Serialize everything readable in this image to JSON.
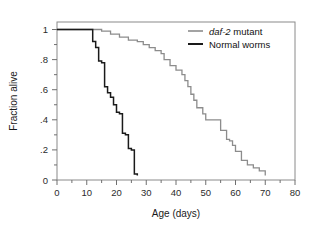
{
  "figure": {
    "background_color": "#ffffff",
    "frame_color": "#8a8a8a"
  },
  "axes": {
    "x_title": "Age (days)",
    "y_title": "Fraction alive",
    "x_ticks": [
      "0",
      "10",
      "20",
      "30",
      "40",
      "50",
      "60",
      "70",
      "80"
    ],
    "y_ticks": [
      "1",
      ".8",
      ".6",
      ".4",
      ".2",
      "0"
    ]
  },
  "legend": {
    "items": [
      {
        "label_italic": "daf-2",
        "label_rest": " mutant",
        "color": "#8c8c8c",
        "key": "daf2-mutant"
      },
      {
        "label_italic": "",
        "label_rest": "Normal worms",
        "color": "#1a1a1a",
        "key": "normal-worms"
      }
    ]
  },
  "chart_data": {
    "type": "line",
    "subtype": "kaplan-meier-survival-step",
    "title": "",
    "xlabel": "Age (days)",
    "ylabel": "Fraction alive",
    "xlim": [
      0,
      80
    ],
    "ylim": [
      0,
      1.05
    ],
    "xticks": [
      0,
      10,
      20,
      30,
      40,
      50,
      60,
      70,
      80
    ],
    "xminor_tick_interval": 5,
    "yticks": [
      0,
      0.2,
      0.4,
      0.6,
      0.8,
      1.0
    ],
    "ytick_labels": [
      "0",
      ".2",
      ".4",
      ".6",
      ".8",
      "1"
    ],
    "grid": false,
    "legend_position": "top-right",
    "series": [
      {
        "name": "daf-2 mutant",
        "color": "#8c8c8c",
        "line_width": 1.3,
        "step": "post",
        "x": [
          0,
          13,
          15,
          18,
          21,
          24,
          27,
          29,
          31,
          33,
          35,
          36,
          38,
          40,
          42,
          43,
          44,
          45,
          46,
          47,
          49,
          50,
          53,
          55,
          57,
          58,
          59,
          60,
          62,
          64,
          66,
          68,
          70
        ],
        "y": [
          1.0,
          1.0,
          0.99,
          0.97,
          0.95,
          0.93,
          0.92,
          0.9,
          0.88,
          0.86,
          0.84,
          0.8,
          0.76,
          0.73,
          0.7,
          0.66,
          0.62,
          0.57,
          0.53,
          0.48,
          0.44,
          0.4,
          0.4,
          0.33,
          0.27,
          0.26,
          0.23,
          0.19,
          0.13,
          0.1,
          0.08,
          0.06,
          0.03
        ]
      },
      {
        "name": "Normal worms",
        "color": "#1a1a1a",
        "line_width": 1.5,
        "step": "post",
        "x": [
          0,
          10,
          12,
          13,
          14,
          15,
          16,
          17,
          18,
          19,
          20,
          21,
          22,
          23,
          24,
          25,
          26,
          27
        ],
        "y": [
          1.0,
          1.0,
          0.92,
          0.88,
          0.79,
          0.78,
          0.62,
          0.58,
          0.55,
          0.5,
          0.45,
          0.44,
          0.31,
          0.3,
          0.21,
          0.2,
          0.04,
          0.03
        ]
      }
    ]
  }
}
